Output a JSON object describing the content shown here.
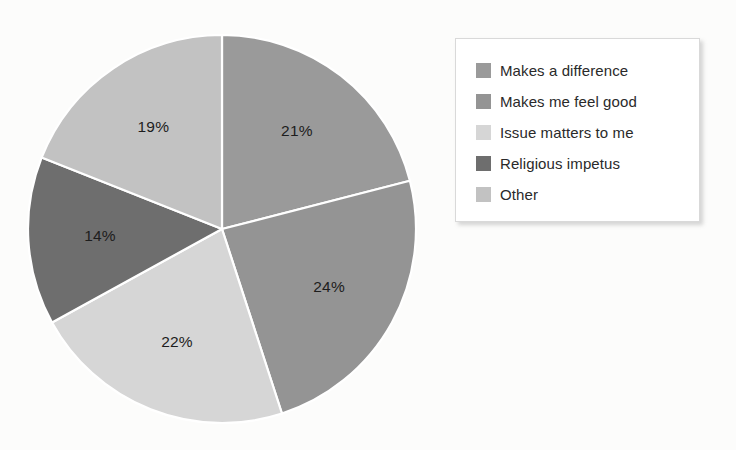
{
  "chart_data": {
    "type": "pie",
    "title": "",
    "subtitle": "",
    "xlabel": "",
    "ylabel": "",
    "categories": [
      "Makes a difference",
      "Makes me feel good",
      "Issue matters to me",
      "Religious impetus",
      "Other"
    ],
    "values": [
      21,
      24,
      22,
      14,
      19
    ],
    "value_labels": [
      "21%",
      "24%",
      "22%",
      "14%",
      "19%"
    ],
    "colors": [
      "#9a9a9a",
      "#949494",
      "#d6d6d6",
      "#6e6e6e",
      "#c2c2c2"
    ],
    "units": "percent",
    "start_angle_deg": 0,
    "direction": "clockwise",
    "slice_border_color": "#ffffff",
    "legend_position": "right",
    "grid": false,
    "slices": [
      {
        "label": "Makes a difference",
        "value": 21,
        "display": "21%",
        "color": "#9a9a9a"
      },
      {
        "label": "Makes me feel good",
        "value": 24,
        "display": "24%",
        "color": "#949494"
      },
      {
        "label": "Issue matters to me",
        "value": 22,
        "display": "22%",
        "color": "#d6d6d6"
      },
      {
        "label": "Religious impetus",
        "value": 14,
        "display": "14%",
        "color": "#6e6e6e"
      },
      {
        "label": "Other",
        "value": 19,
        "display": "19%",
        "color": "#c2c2c2"
      }
    ]
  },
  "legend": {
    "items": [
      {
        "label": "Makes a difference",
        "color": "#9a9a9a"
      },
      {
        "label": "Makes me feel good",
        "color": "#949494"
      },
      {
        "label": "Issue matters to me",
        "color": "#d6d6d6"
      },
      {
        "label": "Religious impetus",
        "color": "#6e6e6e"
      },
      {
        "label": "Other",
        "color": "#c2c2c2"
      }
    ]
  },
  "canvas": {
    "background": "#fcfcfb"
  }
}
